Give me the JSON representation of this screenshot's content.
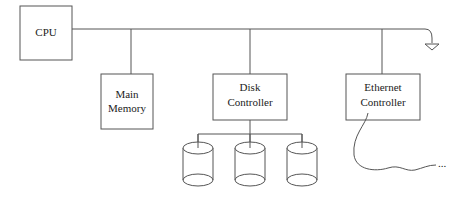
{
  "diagram": {
    "type": "computer-bus-architecture",
    "nodes": {
      "cpu": {
        "label": "CPU"
      },
      "main_memory": {
        "line1": "Main",
        "line2": "Memory"
      },
      "disk_controller": {
        "line1": "Disk",
        "line2": "Controller"
      },
      "ethernet_controller": {
        "line1": "Ethernet",
        "line2": "Controller"
      }
    },
    "disks": [
      {
        "name": "disk-1"
      },
      {
        "name": "disk-2"
      },
      {
        "name": "disk-3"
      }
    ],
    "network_continuation": "...",
    "colors": {
      "line": "#555555",
      "text": "#222222",
      "background": "#ffffff"
    }
  }
}
